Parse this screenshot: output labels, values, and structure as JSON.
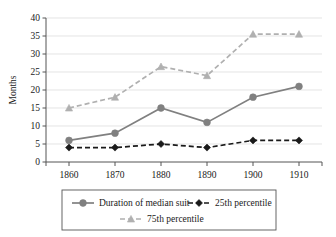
{
  "chart_data": {
    "type": "line",
    "title": "",
    "xlabel": "",
    "ylabel": "Months",
    "x": [
      1860,
      1870,
      1880,
      1890,
      1900,
      1910
    ],
    "categories": [
      "1860",
      "1870",
      "1880",
      "1890",
      "1900",
      "1910"
    ],
    "xlim": [
      1855,
      1915
    ],
    "ylim": [
      0,
      40
    ],
    "yticks": [
      0,
      5,
      10,
      15,
      20,
      25,
      30,
      35,
      40
    ],
    "ytick_labels": [
      "0",
      "5",
      "10",
      "15",
      "20",
      "25",
      "30",
      "35",
      "40"
    ],
    "grid": "horizontal",
    "legend_position": "bottom",
    "series": [
      {
        "name": "Duration of median suit",
        "values": [
          6,
          8,
          15,
          11,
          18,
          21
        ],
        "color": "#808080",
        "line_style": "solid",
        "marker": "circle"
      },
      {
        "name": "25th percentile",
        "values": [
          4,
          4,
          5,
          4,
          6,
          6
        ],
        "color": "#1a1a1a",
        "line_style": "dashed",
        "marker": "diamond"
      },
      {
        "name": "75th percentile",
        "values": [
          15,
          18,
          26.5,
          24,
          35.5,
          35.5
        ],
        "color": "#b0b0b0",
        "line_style": "dashed",
        "marker": "triangle"
      }
    ]
  },
  "legend": {
    "items": [
      {
        "label": "Duration of median suit"
      },
      {
        "label": "25th percentile"
      },
      {
        "label": "75th percentile"
      }
    ]
  },
  "colors": {
    "median": "#808080",
    "p25": "#1a1a1a",
    "p75": "#b0b0b0",
    "grid": "#d9d9d9",
    "axis": "#555555"
  }
}
